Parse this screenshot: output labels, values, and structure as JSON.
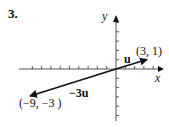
{
  "problem_number": "3.",
  "axes": {
    "x_label": "x",
    "y_label": "y",
    "origin_px": [
      116,
      69
    ],
    "tick_spacing_px": 9.3,
    "x_ticks_left": 9,
    "x_ticks_right": 4,
    "y_ticks_up": 5,
    "y_ticks_down": 5
  },
  "vectors": [
    {
      "name": "u",
      "label": "u",
      "endpoint_label": "(3, 1)",
      "to": [
        3,
        1
      ]
    },
    {
      "name": "neg3u",
      "label": "−3u",
      "endpoint_label": "(−9, −3 )",
      "to": [
        -9,
        -3
      ]
    }
  ]
}
